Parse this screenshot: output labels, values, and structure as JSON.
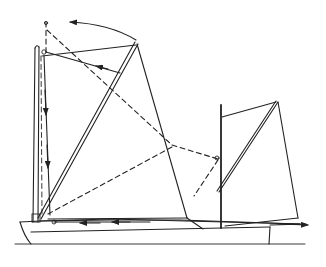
{
  "diagram": {
    "colors": {
      "ink": "#222222",
      "background": "#ffffff"
    },
    "elements": {
      "main_mast": "mainmast",
      "mizzen_mast": "mizzenmast",
      "main_sail": "mainsail",
      "mizzen_sail": "mizzen-sail",
      "hull": "hull",
      "waterline": "waterline"
    }
  }
}
